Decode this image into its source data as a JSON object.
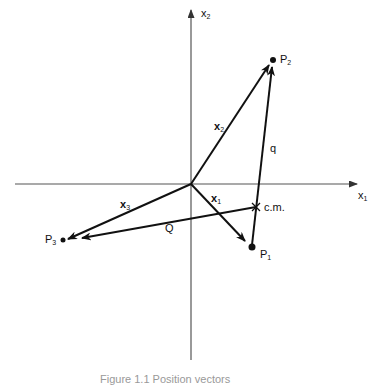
{
  "figure": {
    "axes": {
      "x_label": "x",
      "x_sub": "1",
      "y_label": "x",
      "y_sub": "2"
    },
    "points": {
      "P1": {
        "label": "P",
        "sub": "1"
      },
      "P2": {
        "label": "P",
        "sub": "2"
      },
      "P3": {
        "label": "P",
        "sub": "3"
      },
      "cm": {
        "label": "c.m."
      }
    },
    "vectors": {
      "x1": {
        "label": "x",
        "sub": "1"
      },
      "x2": {
        "label": "x",
        "sub": "2"
      },
      "x3": {
        "label": "x",
        "sub": "3"
      },
      "q": {
        "label": "q"
      },
      "Q": {
        "label": "Q"
      }
    },
    "caption": "Figure 1.1 Position vectors"
  }
}
